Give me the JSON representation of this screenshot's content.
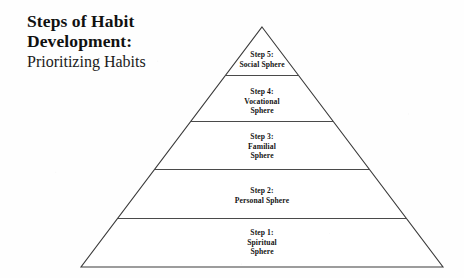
{
  "title": {
    "main": "Steps of Habit\nDevelopment:",
    "subtitle": "Prioritizing Habits"
  },
  "diagram": {
    "type": "pyramid",
    "orientation": "apex-up",
    "tier_count": 5,
    "colors": {
      "background": "#ffffff",
      "outline": "#3a3a3a",
      "divider": "#4a4a4a",
      "text": "#141414"
    },
    "geometry": {
      "apex_x": 262,
      "apex_y": 27,
      "base_left_x": 81,
      "base_right_x": 443,
      "base_y": 267,
      "divider_y": [
        75,
        121,
        169,
        218
      ]
    },
    "tiers": [
      {
        "step_number": 5,
        "step_label": "Step 5:",
        "sphere": "Social Sphere",
        "text": "Step 5:\nSocial Sphere",
        "position": "top"
      },
      {
        "step_number": 4,
        "step_label": "Step 4:",
        "sphere": "Vocational Sphere",
        "text": "Step 4:\nVocational\nSphere",
        "position": "second"
      },
      {
        "step_number": 3,
        "step_label": "Step 3:",
        "sphere": "Familial Sphere",
        "text": "Step 3:\nFamilial\nSphere",
        "position": "middle"
      },
      {
        "step_number": 2,
        "step_label": "Step 2:",
        "sphere": "Personal Sphere",
        "text": "Step 2:\nPersonal Sphere",
        "position": "fourth"
      },
      {
        "step_number": 1,
        "step_label": "Step 1:",
        "sphere": "Spiritual Sphere",
        "text": "Step 1:\nSpiritual\nSphere",
        "position": "base"
      }
    ]
  }
}
